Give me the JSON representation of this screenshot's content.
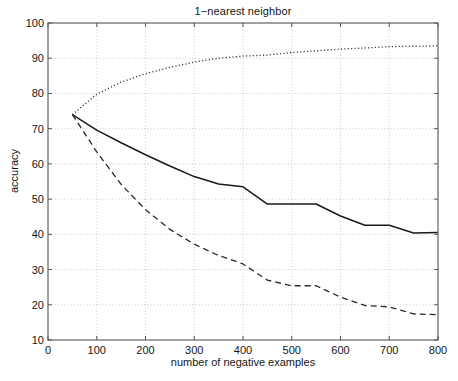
{
  "chart_data": {
    "type": "line",
    "title": "1−nearest neighbor",
    "xlabel": "number of negative examples",
    "ylabel": "accuracy",
    "xlim": [
      0,
      800
    ],
    "ylim": [
      10,
      100
    ],
    "xticks": [
      0,
      100,
      200,
      300,
      400,
      500,
      600,
      700,
      800
    ],
    "yticks": [
      10,
      20,
      30,
      40,
      50,
      60,
      70,
      80,
      90,
      100
    ],
    "grid": true,
    "legend": "none",
    "series": [
      {
        "name": "dotted-upper",
        "style": "dotted",
        "color": "#3a3a3a",
        "x": [
          50,
          100,
          150,
          200,
          250,
          300,
          350,
          400,
          450,
          500,
          550,
          600,
          650,
          700,
          750,
          800
        ],
        "values": [
          74.0,
          79.8,
          83.2,
          85.6,
          87.4,
          88.9,
          90.0,
          90.6,
          90.9,
          91.6,
          92.1,
          92.6,
          92.9,
          93.3,
          93.4,
          93.5
        ]
      },
      {
        "name": "solid-middle",
        "style": "solid",
        "color": "#1a1a1a",
        "x": [
          50,
          100,
          150,
          200,
          250,
          300,
          350,
          400,
          450,
          500,
          550,
          600,
          650,
          700,
          750,
          800
        ],
        "values": [
          74.0,
          69.6,
          66.0,
          62.6,
          59.4,
          56.4,
          54.3,
          53.5,
          48.6,
          48.6,
          48.6,
          45.2,
          42.6,
          42.6,
          40.4,
          40.5
        ]
      },
      {
        "name": "dashed-lower",
        "style": "dashed",
        "color": "#2a2a2a",
        "x": [
          50,
          100,
          150,
          200,
          250,
          300,
          350,
          400,
          450,
          500,
          550,
          600,
          650,
          700,
          750,
          800
        ],
        "values": [
          74.0,
          63.4,
          54.2,
          47.0,
          41.4,
          37.2,
          34.0,
          31.6,
          27.0,
          25.4,
          25.4,
          22.2,
          19.8,
          19.4,
          17.4,
          17.2
        ]
      }
    ]
  },
  "figure": {
    "title": "1−nearest neighbor",
    "axis_color": "#555555",
    "grid_color": "#bdbdbd",
    "background": "#ffffff"
  }
}
